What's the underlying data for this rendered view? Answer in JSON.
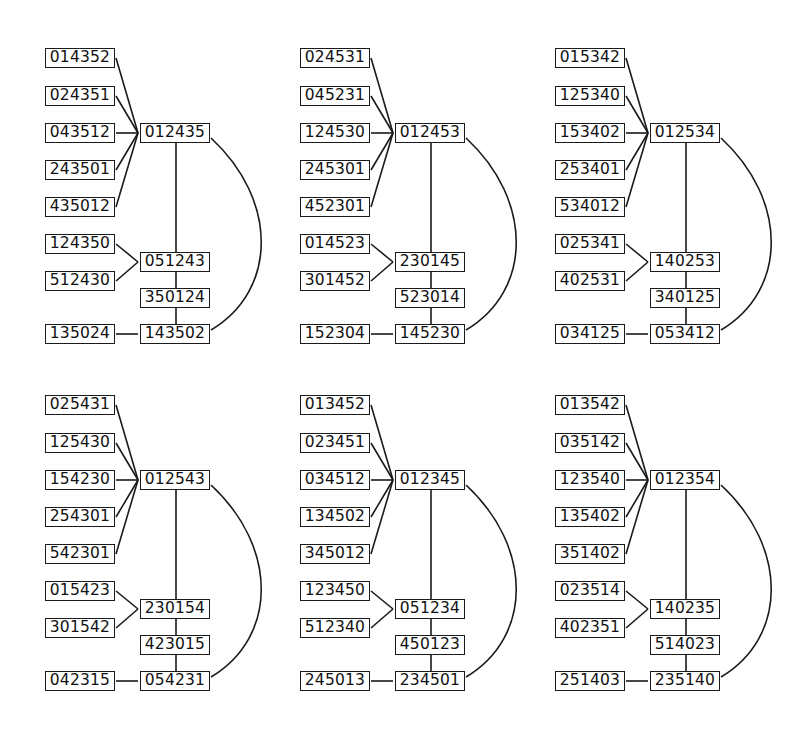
{
  "diagrams": [
    {
      "hub": "012435",
      "hub_leaves": [
        "014352",
        "024351",
        "043512",
        "243501",
        "435012"
      ],
      "mid": "051243",
      "mid_leaves": [
        "124350",
        "512430"
      ],
      "chain": "350124",
      "bottom": "143502",
      "bottom_leaf": "135024"
    },
    {
      "hub": "012453",
      "hub_leaves": [
        "024531",
        "045231",
        "124530",
        "245301",
        "452301"
      ],
      "mid": "230145",
      "mid_leaves": [
        "014523",
        "301452"
      ],
      "chain": "523014",
      "bottom": "145230",
      "bottom_leaf": "152304"
    },
    {
      "hub": "012534",
      "hub_leaves": [
        "015342",
        "125340",
        "153402",
        "253401",
        "534012"
      ],
      "mid": "140253",
      "mid_leaves": [
        "025341",
        "402531"
      ],
      "chain": "340125",
      "bottom": "053412",
      "bottom_leaf": "034125"
    },
    {
      "hub": "012543",
      "hub_leaves": [
        "025431",
        "125430",
        "154230",
        "254301",
        "542301"
      ],
      "mid": "230154",
      "mid_leaves": [
        "015423",
        "301542"
      ],
      "chain": "423015",
      "bottom": "054231",
      "bottom_leaf": "042315"
    },
    {
      "hub": "012345",
      "hub_leaves": [
        "013452",
        "023451",
        "034512",
        "134502",
        "345012"
      ],
      "mid": "051234",
      "mid_leaves": [
        "123450",
        "512340"
      ],
      "chain": "450123",
      "bottom": "234501",
      "bottom_leaf": "245013"
    },
    {
      "hub": "012354",
      "hub_leaves": [
        "013542",
        "035142",
        "123540",
        "135402",
        "351402"
      ],
      "mid": "140235",
      "mid_leaves": [
        "023514",
        "402351"
      ],
      "chain": "514023",
      "bottom": "235140",
      "bottom_leaf": "251403"
    }
  ]
}
